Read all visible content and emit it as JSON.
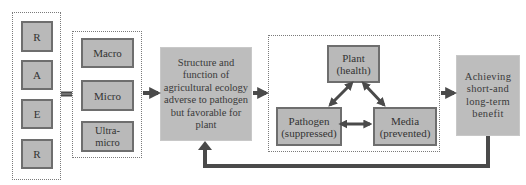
{
  "raer_group": {
    "items": [
      "R",
      "A",
      "E",
      "R"
    ]
  },
  "scale_group": {
    "items": [
      "Macro",
      "Micro",
      "Ultra-micro"
    ]
  },
  "center_box": {
    "text": "Structure and function of agricultural ecology adverse to pathogen but favorable for plant"
  },
  "triangle_group": {
    "plant": "Plant\n(health)",
    "pathogen": "Pathogen\n(suppressed)",
    "media": "Media\n(prevented)"
  },
  "result_box": {
    "text": "Achieving short-and long-term benefit"
  },
  "colors": {
    "box_fill": "#b9b9b9",
    "box_border": "#6e6e6e",
    "arrow": "#4a4a4a",
    "dashed_border": "#7a7a7a"
  }
}
